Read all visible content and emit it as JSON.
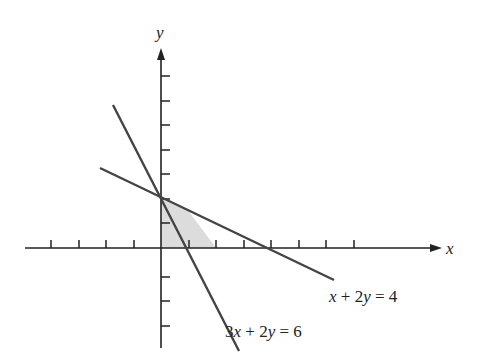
{
  "diagram": {
    "title": "",
    "axes": {
      "x_label": "x",
      "y_label": "y",
      "origin_px": [
        161,
        248
      ],
      "x_unit_px": 27.5,
      "y_unit_px": 24.5,
      "x_ticks": [
        -4,
        -3,
        -2,
        -1,
        1,
        2,
        3,
        4,
        5,
        6,
        7
      ],
      "y_ticks": [
        -3,
        -2,
        -1,
        1,
        2,
        3,
        4,
        5,
        6,
        7
      ]
    },
    "lines": [
      {
        "equation": "3x + 2y = 6",
        "label_parts": [
          "3",
          "x",
          " + 2",
          "y",
          " = 6"
        ],
        "x_intercept": 2,
        "y_intercept": 3
      },
      {
        "equation": "x + 2y = 4",
        "label_parts": [
          "",
          "x",
          " + 2",
          "y",
          " = 4"
        ],
        "x_intercept": 4,
        "y_intercept": 2
      }
    ],
    "feasible_region": {
      "vertices": [
        [
          0,
          0
        ],
        [
          0,
          2
        ],
        [
          1,
          1.5
        ],
        [
          2,
          0
        ]
      ],
      "fill": "#dcdcdc"
    },
    "colors": {
      "axis": "#222222",
      "line": "#444444",
      "shade": "#dcdcdc"
    }
  }
}
